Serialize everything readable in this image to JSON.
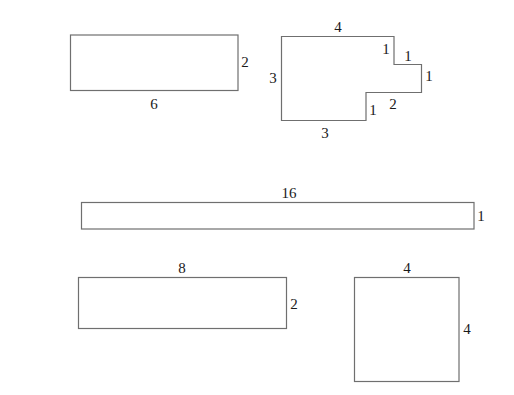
{
  "diagram": {
    "stroke_color": "#6f6f6f",
    "shapes": [
      {
        "id": "rect-6x2",
        "type": "rectangle",
        "labels": [
          {
            "side": "bottom",
            "text": "6"
          },
          {
            "side": "right",
            "text": "2"
          }
        ]
      },
      {
        "id": "composite-L",
        "type": "polygon",
        "labels": [
          {
            "side": "top",
            "text": "4"
          },
          {
            "side": "left",
            "text": "3"
          },
          {
            "side": "bottom",
            "text": "3"
          },
          {
            "side": "notch-top-vertical",
            "text": "1"
          },
          {
            "side": "notch-top-horizontal",
            "text": "1"
          },
          {
            "side": "right",
            "text": "1"
          },
          {
            "side": "notch-bottom-horizontal",
            "text": "2"
          },
          {
            "side": "notch-bottom-vertical",
            "text": "1"
          }
        ]
      },
      {
        "id": "rect-16x1",
        "type": "rectangle",
        "labels": [
          {
            "side": "top",
            "text": "16"
          },
          {
            "side": "right",
            "text": "1"
          }
        ]
      },
      {
        "id": "rect-8x2",
        "type": "rectangle",
        "labels": [
          {
            "side": "top",
            "text": "8"
          },
          {
            "side": "right",
            "text": "2"
          }
        ]
      },
      {
        "id": "square-4x4",
        "type": "rectangle",
        "labels": [
          {
            "side": "top",
            "text": "4"
          },
          {
            "side": "right",
            "text": "4"
          }
        ]
      }
    ]
  }
}
